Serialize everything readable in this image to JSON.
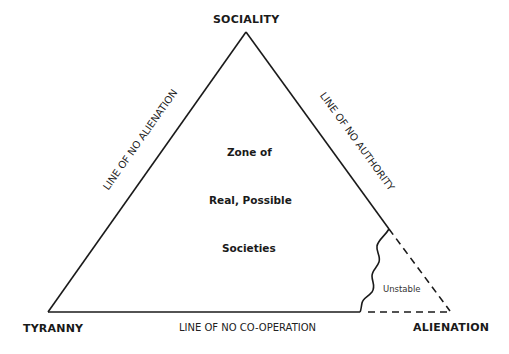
{
  "diagram": {
    "corners": {
      "top": "SOCIALITY",
      "bottom_left": "TYRANNY",
      "bottom_right": "ALIENATION"
    },
    "edges": {
      "left": "LINE OF NO ALIENATION",
      "right": "LINE OF NO AUTHORITY",
      "bottom": "LINE OF NO CO-OPERATION"
    },
    "zone": {
      "line1": "Zone of",
      "line2": "Real, Possible",
      "line3": "Societies"
    },
    "unstable_label": "Unstable",
    "colors": {
      "line": "#1a1a1a",
      "background": "#ffffff"
    }
  }
}
